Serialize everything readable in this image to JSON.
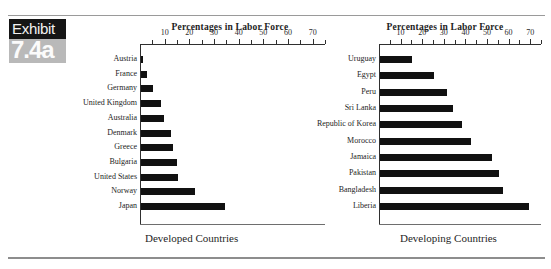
{
  "exhibit": {
    "word": "Exhibit",
    "number": "7.4a"
  },
  "captions": {
    "left": "Developed Countries",
    "right": "Developing Countries"
  },
  "chart_data": [
    {
      "type": "bar",
      "orientation": "horizontal",
      "title": "Percentages in Labor Force",
      "caption": "Developed Countries",
      "xlabel": "",
      "ylabel": "",
      "xlim": [
        0,
        75
      ],
      "ticks": [
        10,
        20,
        30,
        40,
        50,
        60,
        70
      ],
      "tick_labels": [
        "10",
        "20",
        "30",
        "40",
        "50",
        "60",
        "70"
      ],
      "grid": false,
      "legend": "none",
      "bar_color": "#111111",
      "categories": [
        "Austria",
        "France",
        "Germany",
        "United Kingdom",
        "Australia",
        "Denmark",
        "Greece",
        "Bulgaria",
        "United States",
        "Norway",
        "Japan"
      ],
      "values": [
        1,
        2.5,
        5,
        8,
        9.5,
        12,
        13,
        14.5,
        15,
        22,
        34
      ]
    },
    {
      "type": "bar",
      "orientation": "horizontal",
      "title": "Percentages in Labor Force",
      "caption": "Developing Countries",
      "xlabel": "",
      "ylabel": "",
      "xlim": [
        0,
        75
      ],
      "ticks": [
        10,
        20,
        30,
        40,
        50,
        60,
        70
      ],
      "tick_labels": [
        "10",
        "20",
        "30",
        "40",
        "50",
        "60",
        "70"
      ],
      "grid": false,
      "legend": "none",
      "bar_color": "#111111",
      "categories": [
        "Uruguay",
        "Egypt",
        "Peru",
        "Sri Lanka",
        "Republic of Korea",
        "Morocco",
        "Jamaica",
        "Pakistan",
        "Bangladesh",
        "Liberia"
      ],
      "values": [
        15,
        25,
        31,
        34,
        38,
        42,
        52,
        55,
        57,
        69
      ]
    }
  ]
}
